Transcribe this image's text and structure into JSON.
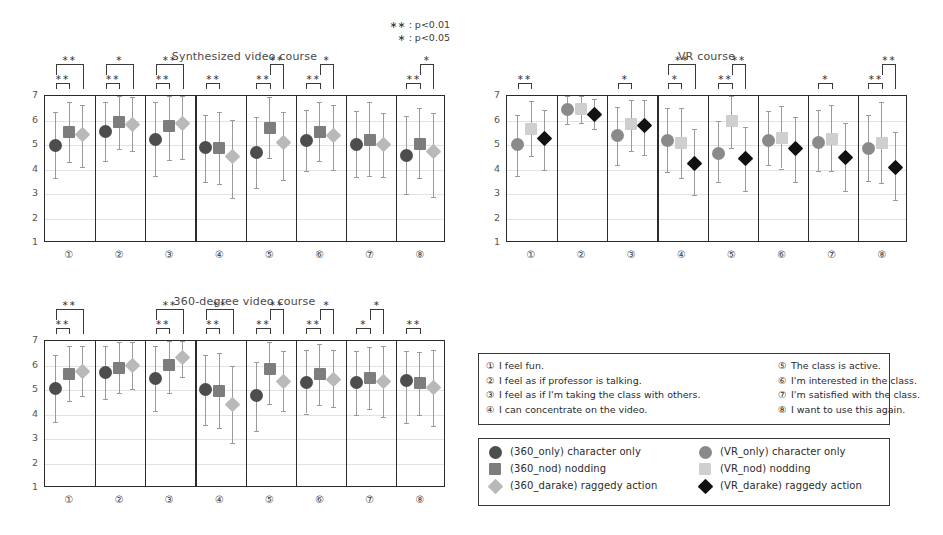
{
  "figure": {
    "pvalue_legend": [
      "∗∗ : p<0.01",
      "∗ : p<0.05"
    ]
  },
  "questions": {
    "left": [
      {
        "num": "①",
        "text": "I feel fun."
      },
      {
        "num": "②",
        "text": "I feel as if professor is talking."
      },
      {
        "num": "③",
        "text": "I feel as if I'm taking the class with others."
      },
      {
        "num": "④",
        "text": "I can concentrate on the video."
      }
    ],
    "right": [
      {
        "num": "⑤",
        "text": "The class is active."
      },
      {
        "num": "⑥",
        "text": "I'm interested in the class."
      },
      {
        "num": "⑦",
        "text": "I'm satisfied with the class."
      },
      {
        "num": "⑧",
        "text": "I want to use this again."
      }
    ]
  },
  "marker_legend": {
    "left": [
      {
        "shape": "circle",
        "color": "#4d4d4d",
        "label": "(360_only)  character only"
      },
      {
        "shape": "square",
        "color": "#7d7d7d",
        "label": "(360_nod)  nodding"
      },
      {
        "shape": "diamond",
        "color": "#b9b9b9",
        "label": "(360_darake)  raggedy action"
      }
    ],
    "right": [
      {
        "shape": "circle",
        "color": "#8a8a8a",
        "label": "(VR_only)  character only"
      },
      {
        "shape": "square",
        "color": "#cfcfcf",
        "label": "(VR_nod)  nodding"
      },
      {
        "shape": "diamond",
        "color": "#111111",
        "label": "(VR_darake)  raggedy action"
      }
    ]
  },
  "chart_data": [
    {
      "id": "synthesized",
      "type": "scatter",
      "title": "Synthesized video course",
      "ylabel": "",
      "xlabel": "",
      "ylim": [
        1,
        7
      ],
      "yticks": [
        1,
        2,
        3,
        4,
        5,
        6,
        7
      ],
      "grid": true,
      "categories": [
        "①",
        "②",
        "③",
        "④",
        "⑤",
        "⑥",
        "⑦",
        "⑧"
      ],
      "series": [
        {
          "name": "character only",
          "shape": "circle",
          "color": "#4d4d4d",
          "values": [
            4.95,
            5.5,
            5.2,
            4.87,
            4.67,
            5.15,
            5.0,
            4.55
          ],
          "err_low": [
            3.6,
            4.3,
            3.7,
            3.45,
            3.2,
            3.9,
            3.65,
            2.95
          ],
          "err_high": [
            6.3,
            6.7,
            6.7,
            6.2,
            6.1,
            6.4,
            6.35,
            6.15
          ]
        },
        {
          "name": "nodding",
          "shape": "square",
          "color": "#7d7d7d",
          "values": [
            5.47,
            5.9,
            5.72,
            4.85,
            5.65,
            5.5,
            5.17,
            5.0
          ],
          "err_low": [
            4.25,
            4.8,
            4.35,
            3.35,
            4.42,
            4.3,
            3.7,
            3.6
          ],
          "err_high": [
            6.7,
            6.95,
            6.95,
            6.3,
            6.9,
            6.7,
            6.7,
            6.45
          ]
        },
        {
          "name": "raggedy action",
          "shape": "diamond",
          "color": "#b9b9b9",
          "values": [
            5.4,
            5.8,
            5.85,
            4.47,
            5.07,
            5.33,
            5.0,
            4.7
          ],
          "err_low": [
            4.05,
            4.7,
            4.4,
            2.8,
            3.55,
            3.95,
            3.65,
            2.85
          ],
          "err_high": [
            6.6,
            6.9,
            6.95,
            6.0,
            6.3,
            6.6,
            6.25,
            6.25
          ]
        }
      ],
      "significance": [
        {
          "panel": 0,
          "inner": "∗∗",
          "outer": "∗∗",
          "outer_span": "1-3"
        },
        {
          "panel": 1,
          "inner": "∗∗",
          "outer": "∗",
          "outer_span": "1-3"
        },
        {
          "panel": 2,
          "inner": "∗∗",
          "outer": "∗∗",
          "outer_span": "1-3"
        },
        {
          "panel": 3,
          "inner": "∗∗",
          "outer": null,
          "outer_span": null
        },
        {
          "panel": 4,
          "inner": "∗∗",
          "outer": "∗∗",
          "outer_span": "2-3"
        },
        {
          "panel": 5,
          "inner": "∗∗",
          "outer": "∗",
          "outer_span": "2-3"
        },
        {
          "panel": 6,
          "inner": null,
          "outer": null,
          "outer_span": null
        },
        {
          "panel": 7,
          "inner": "∗∗",
          "outer": "∗",
          "outer_span": "2-3"
        }
      ]
    },
    {
      "id": "vr",
      "type": "scatter",
      "title": "VR course",
      "ylabel": "",
      "xlabel": "",
      "ylim": [
        1,
        7
      ],
      "yticks": [
        1,
        2,
        3,
        4,
        5,
        6,
        7
      ],
      "grid": true,
      "categories": [
        "①",
        "②",
        "③",
        "④",
        "⑤",
        "⑥",
        "⑦",
        "⑧"
      ],
      "series": [
        {
          "name": "character only",
          "shape": "circle",
          "color": "#8a8a8a",
          "values": [
            4.97,
            6.4,
            5.35,
            5.13,
            4.6,
            5.15,
            5.07,
            4.8
          ],
          "err_low": [
            3.7,
            5.8,
            4.15,
            3.85,
            3.45,
            4.15,
            3.9,
            3.5
          ],
          "err_high": [
            6.2,
            6.95,
            6.5,
            6.45,
            5.95,
            6.35,
            6.4,
            6.2
          ]
        },
        {
          "name": "nodding",
          "shape": "square",
          "color": "#cfcfcf",
          "values": [
            5.62,
            6.42,
            5.8,
            5.05,
            5.95,
            5.25,
            5.2,
            5.05
          ],
          "err_low": [
            4.5,
            5.85,
            4.7,
            3.6,
            4.85,
            4.0,
            3.9,
            3.4
          ],
          "err_high": [
            6.75,
            6.95,
            6.8,
            6.45,
            6.95,
            6.55,
            6.6,
            6.7
          ]
        },
        {
          "name": "raggedy action",
          "shape": "diamond",
          "color": "#111111",
          "values": [
            5.22,
            6.2,
            5.75,
            4.2,
            4.42,
            4.8,
            4.45,
            4.05
          ],
          "err_low": [
            3.95,
            5.6,
            4.55,
            2.9,
            3.1,
            3.45,
            3.1,
            2.7
          ],
          "err_high": [
            6.4,
            6.85,
            6.8,
            5.6,
            5.7,
            6.1,
            5.85,
            5.5
          ]
        }
      ],
      "significance": [
        {
          "panel": 0,
          "inner": "∗∗",
          "outer": null,
          "outer_span": null
        },
        {
          "panel": 1,
          "inner": null,
          "outer": null,
          "outer_span": null
        },
        {
          "panel": 2,
          "inner": "∗",
          "outer": null,
          "outer_span": null
        },
        {
          "panel": 3,
          "inner": "∗",
          "outer": "∗∗",
          "outer_span": "1-3"
        },
        {
          "panel": 4,
          "inner": "∗∗",
          "outer": "∗∗",
          "outer_span": "2-3"
        },
        {
          "panel": 5,
          "inner": null,
          "outer": null,
          "outer_span": null
        },
        {
          "panel": 6,
          "inner": "∗",
          "outer": null,
          "outer_span": null
        },
        {
          "panel": 7,
          "inner": "∗∗",
          "outer": "∗∗",
          "outer_span": "2-3"
        }
      ]
    },
    {
      "id": "degree360",
      "type": "scatter",
      "title": "360-degree video course",
      "ylabel": "",
      "xlabel": "",
      "ylim": [
        1,
        7
      ],
      "yticks": [
        1,
        2,
        3,
        4,
        5,
        6,
        7
      ],
      "grid": true,
      "categories": [
        "①",
        "②",
        "③",
        "④",
        "⑤",
        "⑥",
        "⑦",
        "⑧"
      ],
      "series": [
        {
          "name": "character only",
          "shape": "circle",
          "color": "#4d4d4d",
          "values": [
            5.02,
            5.67,
            5.42,
            4.97,
            4.72,
            5.27,
            5.25,
            5.33,
            5.12
          ],
          "err_low": [
            3.65,
            4.6,
            4.1,
            3.55,
            3.3,
            4.0,
            3.95,
            3.6
          ],
          "err_high": [
            6.4,
            6.75,
            6.75,
            6.4,
            6.1,
            6.6,
            6.55,
            6.55
          ]
        },
        {
          "name": "nodding",
          "shape": "square",
          "color": "#7d7d7d",
          "values": [
            5.62,
            5.87,
            5.97,
            4.92,
            5.8,
            5.6,
            5.45,
            5.25
          ],
          "err_low": [
            4.5,
            4.85,
            4.85,
            3.4,
            4.4,
            4.35,
            4.2,
            3.95
          ],
          "err_high": [
            6.75,
            6.9,
            6.95,
            6.45,
            6.9,
            6.85,
            6.7,
            6.5
          ]
        },
        {
          "name": "raggedy action",
          "shape": "diamond",
          "color": "#b9b9b9",
          "values": [
            5.72,
            5.95,
            6.27,
            4.35,
            5.32,
            5.4,
            5.3,
            5.05
          ],
          "err_low": [
            4.7,
            5.0,
            5.5,
            2.8,
            4.1,
            4.25,
            3.85,
            3.5
          ],
          "err_high": [
            6.75,
            6.9,
            6.95,
            5.95,
            6.55,
            6.6,
            6.75,
            6.6
          ]
        }
      ],
      "significance": [
        {
          "panel": 0,
          "inner": "∗∗",
          "outer": "∗∗",
          "outer_span": "1-3"
        },
        {
          "panel": 1,
          "inner": null,
          "outer": null,
          "outer_span": null
        },
        {
          "panel": 2,
          "inner": "∗∗",
          "outer": "∗∗",
          "outer_span": "1-3"
        },
        {
          "panel": 3,
          "inner": "∗∗",
          "outer": "∗∗",
          "outer_span": "1-3"
        },
        {
          "panel": 4,
          "inner": "∗∗",
          "outer": "∗∗",
          "outer_span": "2-3"
        },
        {
          "panel": 5,
          "inner": "∗∗",
          "outer": "∗",
          "outer_span": "2-3"
        },
        {
          "panel": 6,
          "inner": "∗",
          "outer": "∗",
          "outer_span": "2-3"
        },
        {
          "panel": 7,
          "inner": "∗∗",
          "outer": null,
          "outer_span": null
        }
      ]
    }
  ]
}
